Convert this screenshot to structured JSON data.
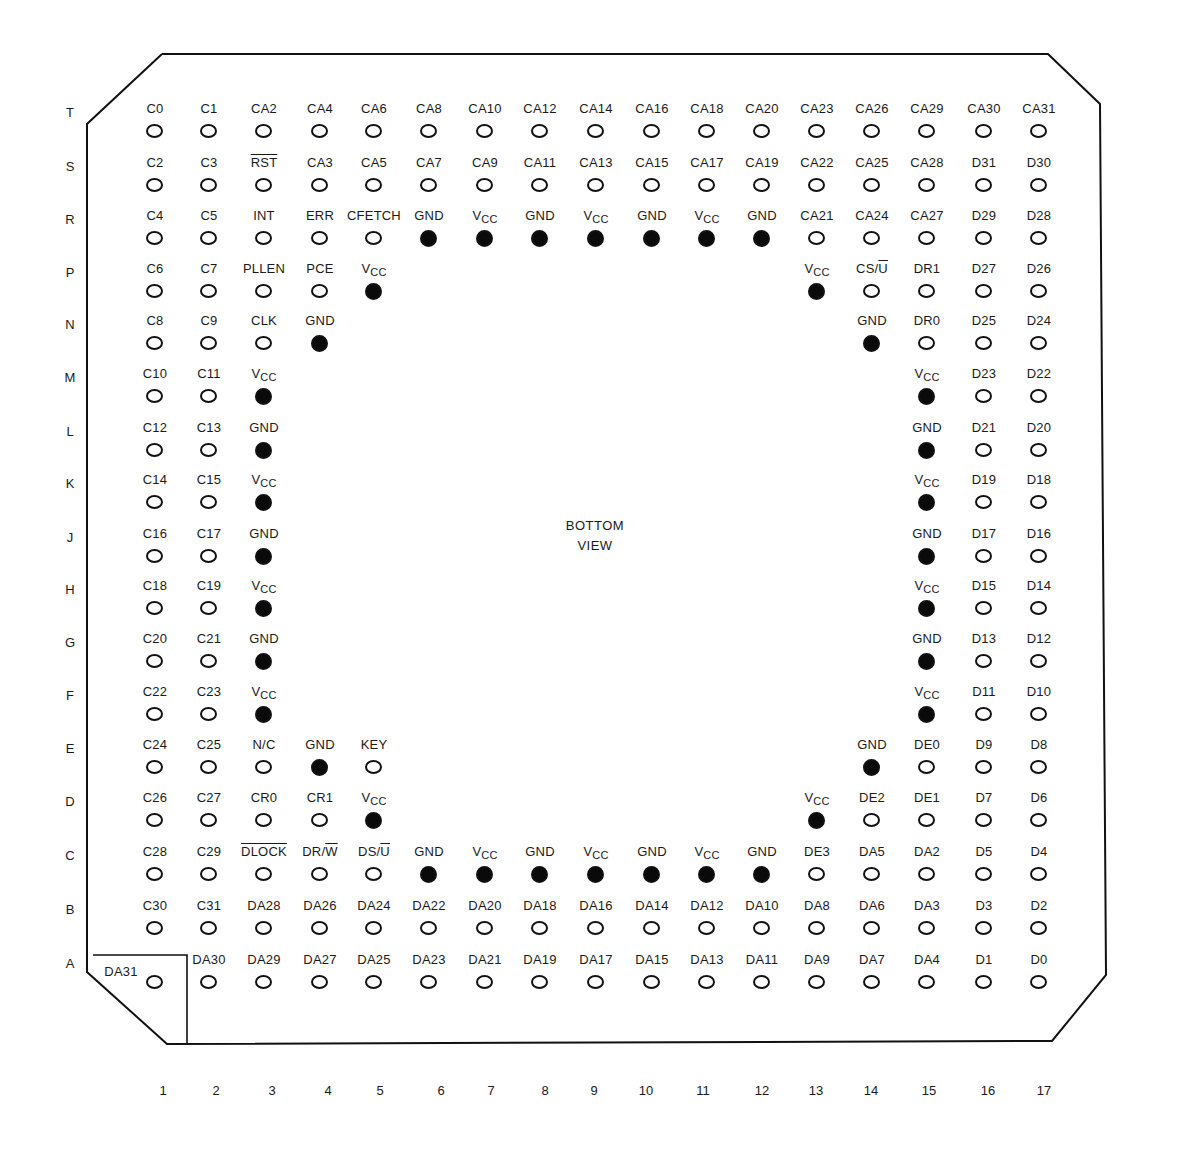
{
  "diagram": {
    "title": "BOTTOM VIEW",
    "center_label_line1": "BOTTOM",
    "center_label_line2": "VIEW",
    "colors": {
      "line": "#111111",
      "background": "#ffffff",
      "filled_pin": "#0a0a0a"
    }
  },
  "rows": [
    "T",
    "S",
    "R",
    "P",
    "N",
    "M",
    "L",
    "K",
    "J",
    "H",
    "G",
    "F",
    "E",
    "D",
    "C",
    "B",
    "A"
  ],
  "columns": [
    "1",
    "2",
    "3",
    "4",
    "5",
    "6",
    "7",
    "8",
    "9",
    "10",
    "11",
    "12",
    "13",
    "14",
    "15",
    "16",
    "17"
  ],
  "legend": {
    "open_circle": "signal pin",
    "filled_circle": "power/ground pin"
  },
  "pins": [
    {
      "row": "T",
      "col": 1,
      "label": "C0",
      "filled": false
    },
    {
      "row": "T",
      "col": 2,
      "label": "C1",
      "filled": false
    },
    {
      "row": "T",
      "col": 3,
      "label": "CA2",
      "filled": false
    },
    {
      "row": "T",
      "col": 4,
      "label": "CA4",
      "filled": false
    },
    {
      "row": "T",
      "col": 5,
      "label": "CA6",
      "filled": false
    },
    {
      "row": "T",
      "col": 6,
      "label": "CA8",
      "filled": false
    },
    {
      "row": "T",
      "col": 7,
      "label": "CA10",
      "filled": false
    },
    {
      "row": "T",
      "col": 8,
      "label": "CA12",
      "filled": false
    },
    {
      "row": "T",
      "col": 9,
      "label": "CA14",
      "filled": false
    },
    {
      "row": "T",
      "col": 10,
      "label": "CA16",
      "filled": false
    },
    {
      "row": "T",
      "col": 11,
      "label": "CA18",
      "filled": false
    },
    {
      "row": "T",
      "col": 12,
      "label": "CA20",
      "filled": false
    },
    {
      "row": "T",
      "col": 13,
      "label": "CA23",
      "filled": false
    },
    {
      "row": "T",
      "col": 14,
      "label": "CA26",
      "filled": false
    },
    {
      "row": "T",
      "col": 15,
      "label": "CA29",
      "filled": false
    },
    {
      "row": "T",
      "col": 16,
      "label": "CA30",
      "filled": false
    },
    {
      "row": "T",
      "col": 17,
      "label": "CA31",
      "filled": false
    },
    {
      "row": "S",
      "col": 1,
      "label": "C2",
      "filled": false
    },
    {
      "row": "S",
      "col": 2,
      "label": "C3",
      "filled": false
    },
    {
      "row": "S",
      "col": 3,
      "label": "RST",
      "overline": true,
      "filled": false
    },
    {
      "row": "S",
      "col": 4,
      "label": "CA3",
      "filled": false
    },
    {
      "row": "S",
      "col": 5,
      "label": "CA5",
      "filled": false
    },
    {
      "row": "S",
      "col": 6,
      "label": "CA7",
      "filled": false
    },
    {
      "row": "S",
      "col": 7,
      "label": "CA9",
      "filled": false
    },
    {
      "row": "S",
      "col": 8,
      "label": "CA11",
      "filled": false
    },
    {
      "row": "S",
      "col": 9,
      "label": "CA13",
      "filled": false
    },
    {
      "row": "S",
      "col": 10,
      "label": "CA15",
      "filled": false
    },
    {
      "row": "S",
      "col": 11,
      "label": "CA17",
      "filled": false
    },
    {
      "row": "S",
      "col": 12,
      "label": "CA19",
      "filled": false
    },
    {
      "row": "S",
      "col": 13,
      "label": "CA22",
      "filled": false
    },
    {
      "row": "S",
      "col": 14,
      "label": "CA25",
      "filled": false
    },
    {
      "row": "S",
      "col": 15,
      "label": "CA28",
      "filled": false
    },
    {
      "row": "S",
      "col": 16,
      "label": "D31",
      "filled": false
    },
    {
      "row": "S",
      "col": 17,
      "label": "D30",
      "filled": false
    },
    {
      "row": "R",
      "col": 1,
      "label": "C4",
      "filled": false
    },
    {
      "row": "R",
      "col": 2,
      "label": "C5",
      "filled": false
    },
    {
      "row": "R",
      "col": 3,
      "label": "INT",
      "filled": false
    },
    {
      "row": "R",
      "col": 4,
      "label": "ERR",
      "filled": false
    },
    {
      "row": "R",
      "col": 5,
      "label": "CFETCH",
      "filled": false
    },
    {
      "row": "R",
      "col": 6,
      "label": "GND",
      "filled": true
    },
    {
      "row": "R",
      "col": 7,
      "label": "VCC",
      "filled": true
    },
    {
      "row": "R",
      "col": 8,
      "label": "GND",
      "filled": true
    },
    {
      "row": "R",
      "col": 9,
      "label": "VCC",
      "filled": true
    },
    {
      "row": "R",
      "col": 10,
      "label": "GND",
      "filled": true
    },
    {
      "row": "R",
      "col": 11,
      "label": "VCC",
      "filled": true
    },
    {
      "row": "R",
      "col": 12,
      "label": "GND",
      "filled": true
    },
    {
      "row": "R",
      "col": 13,
      "label": "CA21",
      "filled": false
    },
    {
      "row": "R",
      "col": 14,
      "label": "CA24",
      "filled": false
    },
    {
      "row": "R",
      "col": 15,
      "label": "CA27",
      "filled": false
    },
    {
      "row": "R",
      "col": 16,
      "label": "D29",
      "filled": false
    },
    {
      "row": "R",
      "col": 17,
      "label": "D28",
      "filled": false
    },
    {
      "row": "P",
      "col": 1,
      "label": "C6",
      "filled": false
    },
    {
      "row": "P",
      "col": 2,
      "label": "C7",
      "filled": false
    },
    {
      "row": "P",
      "col": 3,
      "label": "PLLEN",
      "filled": false
    },
    {
      "row": "P",
      "col": 4,
      "label": "PCE",
      "filled": false
    },
    {
      "row": "P",
      "col": 5,
      "label": "VCC",
      "filled": true
    },
    {
      "row": "P",
      "col": 13,
      "label": "VCC",
      "filled": true
    },
    {
      "row": "P",
      "col": 14,
      "label": "CS/U",
      "overline_part": "U",
      "filled": false
    },
    {
      "row": "P",
      "col": 15,
      "label": "DR1",
      "filled": false
    },
    {
      "row": "P",
      "col": 16,
      "label": "D27",
      "filled": false
    },
    {
      "row": "P",
      "col": 17,
      "label": "D26",
      "filled": false
    },
    {
      "row": "N",
      "col": 1,
      "label": "C8",
      "filled": false
    },
    {
      "row": "N",
      "col": 2,
      "label": "C9",
      "filled": false
    },
    {
      "row": "N",
      "col": 3,
      "label": "CLK",
      "filled": false
    },
    {
      "row": "N",
      "col": 4,
      "label": "GND",
      "filled": true
    },
    {
      "row": "N",
      "col": 14,
      "label": "GND",
      "filled": true
    },
    {
      "row": "N",
      "col": 15,
      "label": "DR0",
      "filled": false
    },
    {
      "row": "N",
      "col": 16,
      "label": "D25",
      "filled": false
    },
    {
      "row": "N",
      "col": 17,
      "label": "D24",
      "filled": false
    },
    {
      "row": "M",
      "col": 1,
      "label": "C10",
      "filled": false
    },
    {
      "row": "M",
      "col": 2,
      "label": "C11",
      "filled": false
    },
    {
      "row": "M",
      "col": 3,
      "label": "VCC",
      "filled": true
    },
    {
      "row": "M",
      "col": 15,
      "label": "VCC",
      "filled": true
    },
    {
      "row": "M",
      "col": 16,
      "label": "D23",
      "filled": false
    },
    {
      "row": "M",
      "col": 17,
      "label": "D22",
      "filled": false
    },
    {
      "row": "L",
      "col": 1,
      "label": "C12",
      "filled": false
    },
    {
      "row": "L",
      "col": 2,
      "label": "C13",
      "filled": false
    },
    {
      "row": "L",
      "col": 3,
      "label": "GND",
      "filled": true
    },
    {
      "row": "L",
      "col": 15,
      "label": "GND",
      "filled": true
    },
    {
      "row": "L",
      "col": 16,
      "label": "D21",
      "filled": false
    },
    {
      "row": "L",
      "col": 17,
      "label": "D20",
      "filled": false
    },
    {
      "row": "K",
      "col": 1,
      "label": "C14",
      "filled": false
    },
    {
      "row": "K",
      "col": 2,
      "label": "C15",
      "filled": false
    },
    {
      "row": "K",
      "col": 3,
      "label": "VCC",
      "filled": true
    },
    {
      "row": "K",
      "col": 15,
      "label": "VCC",
      "filled": true
    },
    {
      "row": "K",
      "col": 16,
      "label": "D19",
      "filled": false
    },
    {
      "row": "K",
      "col": 17,
      "label": "D18",
      "filled": false
    },
    {
      "row": "J",
      "col": 1,
      "label": "C16",
      "filled": false
    },
    {
      "row": "J",
      "col": 2,
      "label": "C17",
      "filled": false
    },
    {
      "row": "J",
      "col": 3,
      "label": "GND",
      "filled": true
    },
    {
      "row": "J",
      "col": 15,
      "label": "GND",
      "filled": true
    },
    {
      "row": "J",
      "col": 16,
      "label": "D17",
      "filled": false
    },
    {
      "row": "J",
      "col": 17,
      "label": "D16",
      "filled": false
    },
    {
      "row": "H",
      "col": 1,
      "label": "C18",
      "filled": false
    },
    {
      "row": "H",
      "col": 2,
      "label": "C19",
      "filled": false
    },
    {
      "row": "H",
      "col": 3,
      "label": "VCC",
      "filled": true
    },
    {
      "row": "H",
      "col": 15,
      "label": "VCC",
      "filled": true
    },
    {
      "row": "H",
      "col": 16,
      "label": "D15",
      "filled": false
    },
    {
      "row": "H",
      "col": 17,
      "label": "D14",
      "filled": false
    },
    {
      "row": "G",
      "col": 1,
      "label": "C20",
      "filled": false
    },
    {
      "row": "G",
      "col": 2,
      "label": "C21",
      "filled": false
    },
    {
      "row": "G",
      "col": 3,
      "label": "GND",
      "filled": true
    },
    {
      "row": "G",
      "col": 15,
      "label": "GND",
      "filled": true
    },
    {
      "row": "G",
      "col": 16,
      "label": "D13",
      "filled": false
    },
    {
      "row": "G",
      "col": 17,
      "label": "D12",
      "filled": false
    },
    {
      "row": "F",
      "col": 1,
      "label": "C22",
      "filled": false
    },
    {
      "row": "F",
      "col": 2,
      "label": "C23",
      "filled": false
    },
    {
      "row": "F",
      "col": 3,
      "label": "VCC",
      "filled": true
    },
    {
      "row": "F",
      "col": 15,
      "label": "VCC",
      "filled": true
    },
    {
      "row": "F",
      "col": 16,
      "label": "D11",
      "filled": false
    },
    {
      "row": "F",
      "col": 17,
      "label": "D10",
      "filled": false
    },
    {
      "row": "E",
      "col": 1,
      "label": "C24",
      "filled": false
    },
    {
      "row": "E",
      "col": 2,
      "label": "C25",
      "filled": false
    },
    {
      "row": "E",
      "col": 3,
      "label": "N/C",
      "filled": false
    },
    {
      "row": "E",
      "col": 4,
      "label": "GND",
      "filled": true
    },
    {
      "row": "E",
      "col": 5,
      "label": "KEY",
      "filled": false
    },
    {
      "row": "E",
      "col": 14,
      "label": "GND",
      "filled": true
    },
    {
      "row": "E",
      "col": 15,
      "label": "DE0",
      "filled": false
    },
    {
      "row": "E",
      "col": 16,
      "label": "D9",
      "filled": false
    },
    {
      "row": "E",
      "col": 17,
      "label": "D8",
      "filled": false
    },
    {
      "row": "D",
      "col": 1,
      "label": "C26",
      "filled": false
    },
    {
      "row": "D",
      "col": 2,
      "label": "C27",
      "filled": false
    },
    {
      "row": "D",
      "col": 3,
      "label": "CR0",
      "filled": false
    },
    {
      "row": "D",
      "col": 4,
      "label": "CR1",
      "filled": false
    },
    {
      "row": "D",
      "col": 5,
      "label": "VCC",
      "filled": true
    },
    {
      "row": "D",
      "col": 13,
      "label": "VCC",
      "filled": true
    },
    {
      "row": "D",
      "col": 14,
      "label": "DE2",
      "filled": false
    },
    {
      "row": "D",
      "col": 15,
      "label": "DE1",
      "filled": false
    },
    {
      "row": "D",
      "col": 16,
      "label": "D7",
      "filled": false
    },
    {
      "row": "D",
      "col": 17,
      "label": "D6",
      "filled": false
    },
    {
      "row": "C",
      "col": 1,
      "label": "C28",
      "filled": false
    },
    {
      "row": "C",
      "col": 2,
      "label": "C29",
      "filled": false
    },
    {
      "row": "C",
      "col": 3,
      "label": "DLOCK",
      "overline": true,
      "filled": false
    },
    {
      "row": "C",
      "col": 4,
      "label": "DR/W",
      "overline_part": "W",
      "filled": false
    },
    {
      "row": "C",
      "col": 5,
      "label": "DS/U",
      "overline_part": "U",
      "filled": false
    },
    {
      "row": "C",
      "col": 6,
      "label": "GND",
      "filled": true
    },
    {
      "row": "C",
      "col": 7,
      "label": "VCC",
      "filled": true
    },
    {
      "row": "C",
      "col": 8,
      "label": "GND",
      "filled": true
    },
    {
      "row": "C",
      "col": 9,
      "label": "VCC",
      "filled": true
    },
    {
      "row": "C",
      "col": 10,
      "label": "GND",
      "filled": true
    },
    {
      "row": "C",
      "col": 11,
      "label": "VCC",
      "filled": true
    },
    {
      "row": "C",
      "col": 12,
      "label": "GND",
      "filled": true
    },
    {
      "row": "C",
      "col": 13,
      "label": "DE3",
      "filled": false
    },
    {
      "row": "C",
      "col": 14,
      "label": "DA5",
      "filled": false
    },
    {
      "row": "C",
      "col": 15,
      "label": "DA2",
      "filled": false
    },
    {
      "row": "C",
      "col": 16,
      "label": "D5",
      "filled": false
    },
    {
      "row": "C",
      "col": 17,
      "label": "D4",
      "filled": false
    },
    {
      "row": "B",
      "col": 1,
      "label": "C30",
      "filled": false
    },
    {
      "row": "B",
      "col": 2,
      "label": "C31",
      "filled": false
    },
    {
      "row": "B",
      "col": 3,
      "label": "DA28",
      "filled": false
    },
    {
      "row": "B",
      "col": 4,
      "label": "DA26",
      "filled": false
    },
    {
      "row": "B",
      "col": 5,
      "label": "DA24",
      "filled": false
    },
    {
      "row": "B",
      "col": 6,
      "label": "DA22",
      "filled": false
    },
    {
      "row": "B",
      "col": 7,
      "label": "DA20",
      "filled": false
    },
    {
      "row": "B",
      "col": 8,
      "label": "DA18",
      "filled": false
    },
    {
      "row": "B",
      "col": 9,
      "label": "DA16",
      "filled": false
    },
    {
      "row": "B",
      "col": 10,
      "label": "DA14",
      "filled": false
    },
    {
      "row": "B",
      "col": 11,
      "label": "DA12",
      "filled": false
    },
    {
      "row": "B",
      "col": 12,
      "label": "DA10",
      "filled": false
    },
    {
      "row": "B",
      "col": 13,
      "label": "DA8",
      "filled": false
    },
    {
      "row": "B",
      "col": 14,
      "label": "DA6",
      "filled": false
    },
    {
      "row": "B",
      "col": 15,
      "label": "DA3",
      "filled": false
    },
    {
      "row": "B",
      "col": 16,
      "label": "D3",
      "filled": false
    },
    {
      "row": "B",
      "col": 17,
      "label": "D2",
      "filled": false
    },
    {
      "row": "A",
      "col": 1,
      "label": "DA31",
      "filled": false,
      "index_pin": true
    },
    {
      "row": "A",
      "col": 2,
      "label": "DA30",
      "filled": false
    },
    {
      "row": "A",
      "col": 3,
      "label": "DA29",
      "filled": false
    },
    {
      "row": "A",
      "col": 4,
      "label": "DA27",
      "filled": false
    },
    {
      "row": "A",
      "col": 5,
      "label": "DA25",
      "filled": false
    },
    {
      "row": "A",
      "col": 6,
      "label": "DA23",
      "filled": false
    },
    {
      "row": "A",
      "col": 7,
      "label": "DA21",
      "filled": false
    },
    {
      "row": "A",
      "col": 8,
      "label": "DA19",
      "filled": false
    },
    {
      "row": "A",
      "col": 9,
      "label": "DA17",
      "filled": false
    },
    {
      "row": "A",
      "col": 10,
      "label": "DA15",
      "filled": false
    },
    {
      "row": "A",
      "col": 11,
      "label": "DA13",
      "filled": false
    },
    {
      "row": "A",
      "col": 12,
      "label": "DA11",
      "filled": false
    },
    {
      "row": "A",
      "col": 13,
      "label": "DA9",
      "filled": false
    },
    {
      "row": "A",
      "col": 14,
      "label": "DA7",
      "filled": false
    },
    {
      "row": "A",
      "col": 15,
      "label": "DA4",
      "filled": false
    },
    {
      "row": "A",
      "col": 16,
      "label": "D1",
      "filled": false
    },
    {
      "row": "A",
      "col": 17,
      "label": "D0",
      "filled": false
    }
  ]
}
